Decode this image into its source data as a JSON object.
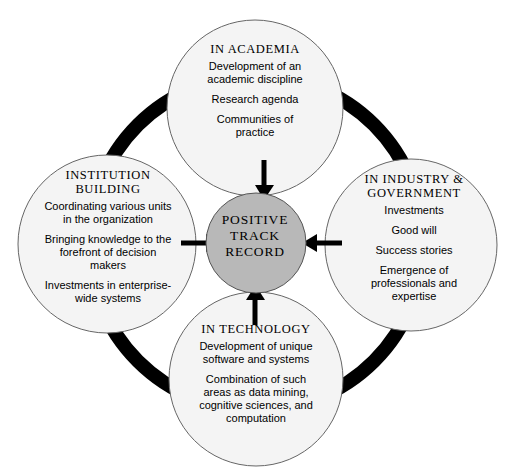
{
  "diagram": {
    "type": "hub-and-spoke cycle diagram",
    "center": {
      "label": "POSITIVE\nTRACK\nRECORD",
      "fill_color": "#b8b8b8",
      "stroke_color": "#555555"
    },
    "ring": {
      "color": "#000000",
      "thickness": 14
    },
    "nodes": [
      {
        "id": "academia",
        "position": "top",
        "title": "IN ACADEMIA",
        "lines": [
          "Development of an\nacademic discipline",
          "Research agenda",
          "Communities of\npractice"
        ],
        "fill_color": "#f4f4f4",
        "stroke_color": "#666666"
      },
      {
        "id": "institution",
        "position": "left",
        "title": "INSTITUTION\nBUILDING",
        "lines": [
          "Coordinating various units\nin the organization",
          "Bringing knowledge to the\nforefront of decision\nmakers",
          "Investments in enterprise-\nwide systems"
        ],
        "fill_color": "#f4f4f4",
        "stroke_color": "#666666"
      },
      {
        "id": "industry",
        "position": "right",
        "title": "IN INDUSTRY &\nGOVERNMENT",
        "lines": [
          "Investments",
          "Good will",
          "Success stories",
          "Emergence of\nprofessionals and\nexpertise"
        ],
        "fill_color": "#f4f4f4",
        "stroke_color": "#666666"
      },
      {
        "id": "technology",
        "position": "bottom",
        "title": "IN TECHNOLOGY",
        "lines": [
          "Development of unique\nsoftware and systems",
          "Combination of such\nareas as data mining,\ncognitive sciences, and\ncomputation"
        ],
        "fill_color": "#f4f4f4",
        "stroke_color": "#666666"
      }
    ],
    "arrows": [
      {
        "id": "academia-to-center",
        "direction": "down",
        "from": "academia",
        "to": "center"
      },
      {
        "id": "institution-to-center",
        "direction": "right",
        "from": "institution",
        "to": "center"
      },
      {
        "id": "industry-to-center",
        "direction": "left",
        "from": "industry",
        "to": "center"
      },
      {
        "id": "technology-to-center",
        "direction": "up",
        "from": "technology",
        "to": "center"
      }
    ]
  }
}
